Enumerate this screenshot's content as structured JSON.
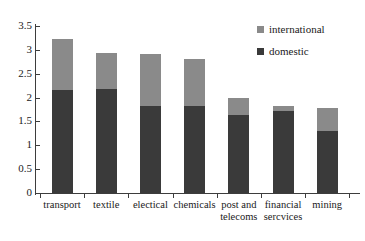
{
  "chart_data": {
    "type": "bar",
    "subtype": "stacked-bar",
    "title": "",
    "xlabel": "",
    "ylabel": "",
    "ylim": [
      0,
      3.5
    ],
    "ytick_labels": [
      "3.5",
      "3",
      "2.5",
      "2",
      "1.5",
      "1",
      "0.5",
      "0"
    ],
    "ytick_values": [
      3.5,
      3,
      2.5,
      2,
      1.5,
      1,
      0.5,
      0
    ],
    "grid": false,
    "legend_position": "top-right",
    "categories": [
      "transport",
      "textile",
      "electical",
      "chemicals",
      "post and telecoms",
      "financial sercvices",
      "mining"
    ],
    "category_lines": [
      [
        "transport",
        ""
      ],
      [
        "textile",
        ""
      ],
      [
        "electical",
        ""
      ],
      [
        "chemicals",
        ""
      ],
      [
        "post and",
        "telecoms"
      ],
      [
        "financial",
        "sercvices"
      ],
      [
        "mining",
        ""
      ]
    ],
    "series": [
      {
        "name": "domestic",
        "color": "#3a3a3a",
        "values": [
          2.15,
          2.17,
          1.82,
          1.83,
          1.63,
          1.72,
          1.31
        ]
      },
      {
        "name": "international",
        "color": "#8a8a8a",
        "values": [
          1.08,
          0.77,
          1.09,
          0.98,
          0.37,
          0.11,
          0.48
        ]
      }
    ],
    "totals": [
      3.23,
      2.94,
      2.91,
      2.81,
      2.0,
      1.83,
      1.79
    ],
    "stack_order_bottom_to_top": [
      "domestic",
      "international"
    ]
  },
  "legend": {
    "items": [
      {
        "label": "international",
        "color": "#8a8a8a"
      },
      {
        "label": "domestic",
        "color": "#3a3a3a"
      }
    ]
  },
  "colors": {
    "domestic": "#3a3a3a",
    "international": "#8a8a8a",
    "axis": "#3d3d3d",
    "text": "#1a1a1a",
    "background": "#ffffff"
  }
}
